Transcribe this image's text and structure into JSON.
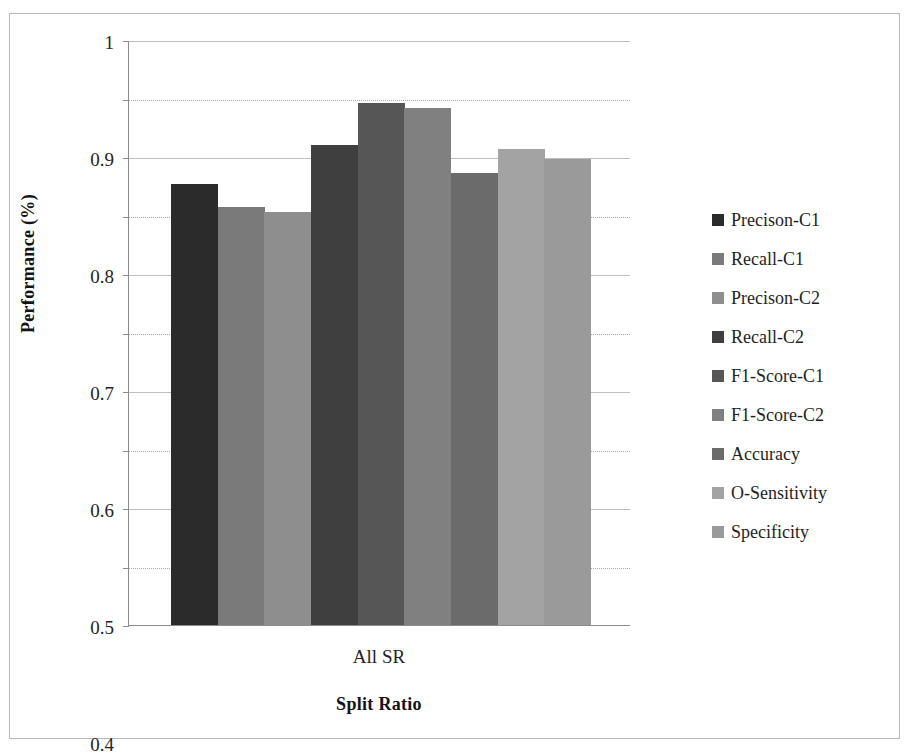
{
  "chart_data": {
    "type": "bar",
    "title": "",
    "xlabel": "Split Ratio",
    "ylabel": "Performance (%)",
    "categories": [
      "All SR"
    ],
    "ylim": [
      0,
      1
    ],
    "ytick_labels": [
      "1",
      "0.9",
      "0.8",
      "0.7",
      "0.6",
      "0.5",
      "0.4",
      "0.3",
      "0.2",
      "0.1",
      "0"
    ],
    "ytick_values": [
      1,
      0.9,
      0.8,
      0.7,
      0.6,
      0.5,
      0.4,
      0.3,
      0.2,
      0.1,
      0
    ],
    "grid": "horizontal-dotted",
    "legend_position": "right",
    "series": [
      {
        "name": "Precison-C1",
        "values": [
          0.754
        ],
        "color": "#2b2b2b"
      },
      {
        "name": "Recall-C1",
        "values": [
          0.714
        ],
        "color": "#7a7a7a"
      },
      {
        "name": "Precison-C2",
        "values": [
          0.706
        ],
        "color": "#8e8e8e"
      },
      {
        "name": "Recall-C2",
        "values": [
          0.82
        ],
        "color": "#3f3f3f"
      },
      {
        "name": "F1-Score-C1",
        "values": [
          0.892
        ],
        "color": "#565656"
      },
      {
        "name": "F1-Score-C2",
        "values": [
          0.883
        ],
        "color": "#808080"
      },
      {
        "name": "Accuracy",
        "values": [
          0.772
        ],
        "color": "#6b6b6b"
      },
      {
        "name": "O-Sensitivity",
        "values": [
          0.813
        ],
        "color": "#a3a3a3"
      },
      {
        "name": "Specificity",
        "values": [
          0.797
        ],
        "color": "#9a9a9a"
      }
    ]
  },
  "axis": {
    "y_title": "Performance (%)",
    "x_title": "Split Ratio",
    "x_category": "All SR"
  },
  "legend": {
    "items": [
      {
        "label": "Precison-C1",
        "color": "#2b2b2b"
      },
      {
        "label": "Recall-C1",
        "color": "#7a7a7a"
      },
      {
        "label": "Precison-C2",
        "color": "#8e8e8e"
      },
      {
        "label": "Recall-C2",
        "color": "#3f3f3f"
      },
      {
        "label": "F1-Score-C1",
        "color": "#565656"
      },
      {
        "label": "F1-Score-C2",
        "color": "#808080"
      },
      {
        "label": "Accuracy",
        "color": "#6b6b6b"
      },
      {
        "label": "O-Sensitivity",
        "color": "#a3a3a3"
      },
      {
        "label": "Specificity",
        "color": "#9a9a9a"
      }
    ]
  }
}
